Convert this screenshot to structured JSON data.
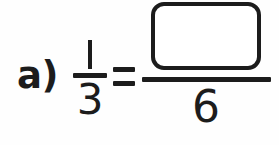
{
  "problem": {
    "label": "a)",
    "left_fraction": {
      "numerator": "1",
      "denominator": "3"
    },
    "relation": "=",
    "right_fraction": {
      "numerator": "",
      "numerator_is_blank_box": true,
      "denominator": "6"
    },
    "full_expression": "a) 1/3 = ?/6"
  },
  "style": {
    "ink_color": "#1c1c1c",
    "background_color": "#fefefe",
    "box_fill_color": "#ffffff"
  }
}
